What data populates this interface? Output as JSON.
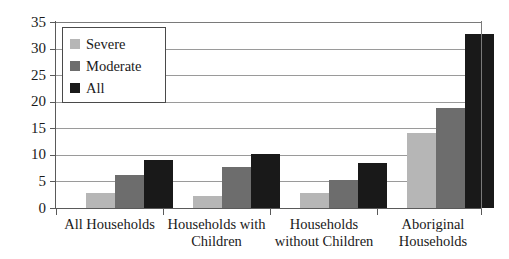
{
  "chart_data": {
    "type": "bar",
    "title": "",
    "subtitle": "",
    "xlabel": "",
    "ylabel": "",
    "ylim": [
      0,
      35
    ],
    "yticks": [
      0,
      5,
      10,
      15,
      20,
      25,
      30,
      35
    ],
    "ytick_labels": [
      "0",
      "5",
      "10",
      "15",
      "20",
      "25",
      "30",
      "35"
    ],
    "grid": true,
    "legend_position": "upper-left-inside",
    "categories": [
      "All Households",
      "Households with Children",
      "Households without Children",
      "Aboriginal Households"
    ],
    "category_lines": [
      [
        "All Households"
      ],
      [
        "Households with",
        "Children"
      ],
      [
        "Households",
        "without Children"
      ],
      [
        "Aboriginal",
        "Households"
      ]
    ],
    "series": [
      {
        "name": "Severe",
        "color": "#b6b6b6",
        "values": [
          2.8,
          2.2,
          2.9,
          14.2
        ]
      },
      {
        "name": "Moderate",
        "color": "#6d6d6d",
        "values": [
          6.2,
          7.7,
          5.3,
          18.8
        ]
      },
      {
        "name": "All",
        "color": "#191919",
        "values": [
          9.1,
          10.1,
          8.4,
          32.8
        ]
      }
    ]
  },
  "legend": {
    "items": [
      {
        "label": "Severe",
        "color": "#b6b6b6"
      },
      {
        "label": "Moderate",
        "color": "#6d6d6d"
      },
      {
        "label": "All",
        "color": "#191919"
      }
    ]
  },
  "colors": {
    "severe": "#b6b6b6",
    "moderate": "#6d6d6d",
    "all": "#191919",
    "axis": "#5a5a5a",
    "grid": "#9a9a9a",
    "background": "#ffffff"
  }
}
